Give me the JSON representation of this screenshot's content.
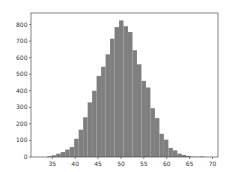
{
  "chart_data": {
    "type": "bar",
    "title": "",
    "xlabel": "",
    "ylabel": "",
    "bin_width": 0.98,
    "bin_start": 33.9,
    "values": [
      5,
      10,
      20,
      30,
      45,
      60,
      110,
      165,
      240,
      330,
      400,
      490,
      545,
      620,
      715,
      785,
      825,
      790,
      755,
      645,
      560,
      460,
      420,
      295,
      235,
      140,
      105,
      55,
      40,
      20,
      12,
      6,
      2,
      1,
      3
    ],
    "xlim": [
      30.35,
      71.2
    ],
    "ylim": [
      0,
      870
    ],
    "xticks": [
      35,
      40,
      45,
      50,
      55,
      60,
      65,
      70
    ],
    "yticks": [
      0,
      100,
      200,
      300,
      400,
      500,
      600,
      700,
      800
    ],
    "bar_color": "#7f7f7f",
    "grid": false,
    "legend": null
  },
  "axes": {
    "left": 31,
    "top": 13,
    "right": 218,
    "bottom": 157
  }
}
